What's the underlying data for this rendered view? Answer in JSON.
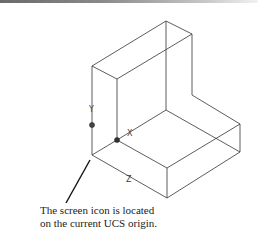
{
  "figure": {
    "axis_labels": {
      "x": "X",
      "y": "Y",
      "z": "Z"
    },
    "caption_lines": [
      "The screen icon is located",
      "on the current UCS origin."
    ],
    "colors": {
      "line": "#333333",
      "background": "#ffffff"
    }
  }
}
